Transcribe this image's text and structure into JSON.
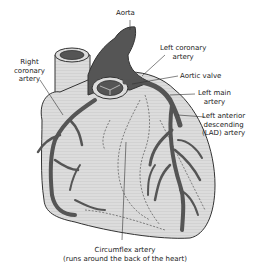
{
  "diagram": {
    "colors": {
      "heart_fill": "#d9d9d9",
      "artery_fill": "#555555",
      "outline": "#333333",
      "background": "#ffffff"
    },
    "labels": {
      "aorta": "Aorta",
      "left_coronary_artery_1": "Left coronary",
      "left_coronary_artery_2": "artery",
      "right_coronary_artery_1": "Right",
      "right_coronary_artery_2": "coronary",
      "right_coronary_artery_3": "artery",
      "aortic_valve": "Aortic valve",
      "left_main_artery_1": "Left main",
      "left_main_artery_2": "artery",
      "lad_artery_1": "Left anterior",
      "lad_artery_2": "descending",
      "lad_artery_3": "(LAD) artery",
      "circumflex_artery_1": "Circumflex artery",
      "circumflex_artery_2": "(runs around the back of the heart)"
    }
  }
}
